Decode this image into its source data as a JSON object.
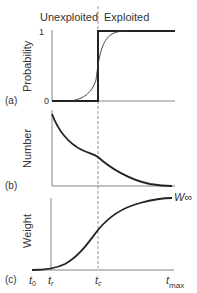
{
  "header": {
    "left": "Unexploited",
    "right": "Exploited"
  },
  "panel_a": {
    "label": "(a)",
    "ylabel": "Probability",
    "ytick_top": "1",
    "ytick_bottom": "0"
  },
  "panel_b": {
    "label": "(b)",
    "ylabel": "Number"
  },
  "panel_c": {
    "label": "(c)",
    "ylabel": "Weight",
    "asymptote": "W∞",
    "xticks": {
      "t0": "t",
      "t0_sub": "0",
      "tr": "t",
      "tr_sub": "r",
      "tc": "t",
      "tc_sub": "c",
      "tmax": "t",
      "tmax_sub": "max"
    }
  },
  "colors": {
    "line": "#222222",
    "axis": "#555555",
    "dash": "#777777"
  }
}
